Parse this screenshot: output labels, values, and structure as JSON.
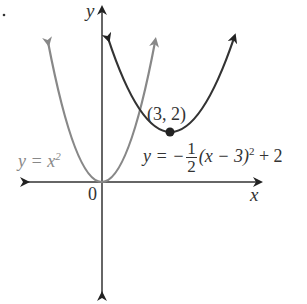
{
  "figure": {
    "marker": ".",
    "axes": {
      "x_label": "x",
      "y_label": "y",
      "origin_label": "0"
    },
    "curves": [
      {
        "id": "y=x^2",
        "label_lhs": "y = x",
        "label_exp": "2",
        "color": "#888888"
      },
      {
        "id": "y=-1/2(x-3)^2+2",
        "label_prefix": "y = −",
        "frac_num": "1",
        "frac_den": "2",
        "label_suffix": "(x − 3)",
        "label_exp": "2",
        "label_tail": " + 2",
        "color": "#333333"
      }
    ],
    "point": {
      "label": "(3, 2)"
    }
  }
}
